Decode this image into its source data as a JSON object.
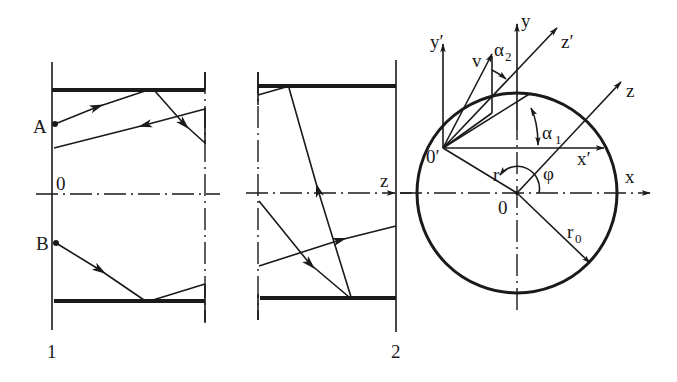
{
  "figure": {
    "left_panel": {
      "point_A": "A",
      "point_B": "B",
      "origin": "0",
      "section_label": "1"
    },
    "middle_panel": {
      "axis_z": "z",
      "section_label": "2"
    },
    "right_panel": {
      "axis_y_prime": "y′",
      "axis_y": "y",
      "axis_z_prime": "z′",
      "axis_z": "z",
      "axis_x_prime": "x′",
      "axis_x": "x",
      "velocity": "v",
      "alpha2_main": "α",
      "alpha2_sub": "2",
      "alpha1_main": "α",
      "alpha1_sub": "1",
      "origin_prime": "0′",
      "origin": "0",
      "radius_r": "r",
      "radius_r0_main": "r",
      "radius_r0_sub": "0",
      "angle_phi": "φ"
    }
  },
  "colors": {
    "ink": "#1a1a1a",
    "background": "#ffffff"
  }
}
